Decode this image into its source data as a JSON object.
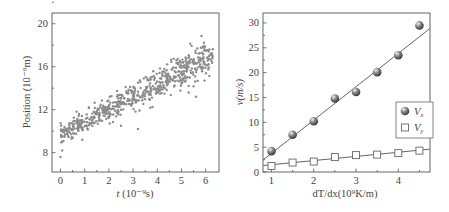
{
  "chart_data": [
    {
      "type": "scatter",
      "title": "",
      "xlabel_italic": "t",
      "xlabel_rest": " (10⁻⁹s)",
      "ylabel": "Position (10⁻⁹m)",
      "xlim": [
        -0.35,
        6.55
      ],
      "ylim": [
        6.2,
        21
      ],
      "xticks": [
        0,
        1,
        2,
        3,
        4,
        5,
        6
      ],
      "yticks": [
        8,
        12,
        16,
        20
      ],
      "grid": false,
      "trend": {
        "intercept": 9.6,
        "slope": 1.2,
        "noise_sd": 0.7
      },
      "n_points": 620,
      "outliers": [
        [
          0.0,
          7.6
        ],
        [
          3.2,
          10.2
        ],
        [
          2.5,
          10.5
        ],
        [
          5.6,
          13.2
        ],
        [
          5.3,
          13.6
        ],
        [
          0.9,
          9.2
        ]
      ],
      "point_color": "#8c8c8c"
    },
    {
      "type": "scatter",
      "title": "",
      "xlabel": "dT/dx(10⁹K/m)",
      "ylabel": "v(m/s)",
      "xlim": [
        0.8,
        4.75
      ],
      "ylim": [
        0,
        32
      ],
      "xticks": [
        1,
        2,
        3,
        4
      ],
      "yticks": [
        0,
        5,
        10,
        15,
        20,
        25,
        30
      ],
      "grid": false,
      "legend_position": "lower right (inside)",
      "x": [
        1,
        1.5,
        2,
        2.5,
        3,
        3.5,
        4,
        4.5
      ],
      "series": [
        {
          "name": "V",
          "subscript": "x",
          "marker": "filled-sphere",
          "values": [
            4.2,
            7.5,
            10.2,
            14.8,
            16.1,
            20.1,
            23.5,
            29.5
          ],
          "fit": [
            [
              0.8,
              2.4
            ],
            [
              4.75,
              28.9
            ]
          ]
        },
        {
          "name": "V",
          "subscript": "y",
          "marker": "open-square",
          "values": [
            1.2,
            1.9,
            2.1,
            3.0,
            3.4,
            3.5,
            3.8,
            4.3
          ],
          "fit": [
            [
              0.8,
              1.3
            ],
            [
              4.75,
              4.6
            ]
          ]
        }
      ]
    }
  ]
}
